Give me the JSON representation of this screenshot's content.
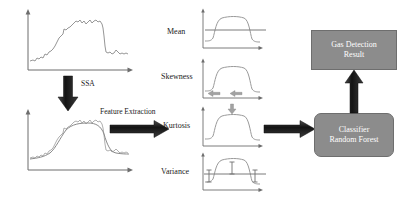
{
  "diagram": {
    "colors": {
      "box_fill": "#8c8c8c",
      "box_border": "#6e6e6e",
      "box_text": "#ffffff",
      "arrow_dark": "#1c1c1c",
      "arrow_gray": "#9a9a9a",
      "curve": "#8a8a8a",
      "axis": "#6d6d6d",
      "background": "#ffffff"
    },
    "steps": {
      "ssa_label": "SSA",
      "feature_extraction_label": "Feature Extraction"
    },
    "signals": {
      "raw": {
        "name": "raw-sensor-signal",
        "description": "noisy rising plateau signal"
      },
      "denoised": {
        "name": "ssa-denoised-signal",
        "description": "noisy signal overlaid with smoothed SSA reconstruction"
      }
    },
    "features": [
      {
        "id": "mean",
        "label": "Mean",
        "marker": "horizontal-level-line"
      },
      {
        "id": "skewness",
        "label": "Skewness",
        "marker": "opposing-horizontal-arrows"
      },
      {
        "id": "kurtosis",
        "label": "Kurtosis",
        "marker": "downward-arrow-at-peak"
      },
      {
        "id": "variance",
        "label": "Variance",
        "marker": "error-bar-ticks-on-level-line"
      }
    ],
    "boxes": {
      "classifier": {
        "line1": "Classifier",
        "line2": "Random Forest"
      },
      "result": {
        "line1": "Gas Detection",
        "line2": "Result"
      }
    }
  }
}
